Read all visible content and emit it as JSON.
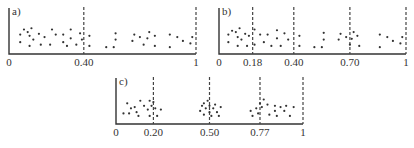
{
  "chart_data": [
    {
      "type": "scatter",
      "panel_label": "a)",
      "x_axis": {
        "min": 0,
        "max": 1,
        "tick_labels": [
          "0",
          "0.40",
          "1"
        ]
      },
      "dashed_lines": [
        0.4,
        1
      ],
      "layout": {
        "x0": 9,
        "x1": 196,
        "y_base": 54,
        "y_top": 8,
        "label_y": 66
      },
      "points": [
        [
          0.06,
          0.35
        ],
        [
          0.06,
          0.65
        ],
        [
          0.08,
          0.85
        ],
        [
          0.1,
          0.75
        ],
        [
          0.11,
          0.6
        ],
        [
          0.12,
          0.9
        ],
        [
          0.13,
          0.45
        ],
        [
          0.11,
          0.2
        ],
        [
          0.16,
          0.68
        ],
        [
          0.17,
          0.25
        ],
        [
          0.19,
          0.55
        ],
        [
          0.22,
          0.25
        ],
        [
          0.23,
          0.85
        ],
        [
          0.25,
          0.65
        ],
        [
          0.29,
          0.35
        ],
        [
          0.29,
          0.65
        ],
        [
          0.31,
          0.2
        ],
        [
          0.33,
          0.85
        ],
        [
          0.33,
          0.5
        ],
        [
          0.36,
          0.25
        ],
        [
          0.38,
          0.7
        ],
        [
          0.39,
          0.45
        ],
        [
          0.43,
          0.6
        ],
        [
          0.43,
          0.2
        ],
        [
          0.52,
          0.15
        ],
        [
          0.56,
          0.15
        ],
        [
          0.57,
          0.45
        ],
        [
          0.57,
          0.7
        ],
        [
          0.66,
          0.4
        ],
        [
          0.67,
          0.65
        ],
        [
          0.7,
          0.55
        ],
        [
          0.72,
          0.25
        ],
        [
          0.74,
          0.5
        ],
        [
          0.75,
          0.75
        ],
        [
          0.78,
          0.6
        ],
        [
          0.78,
          0.2
        ],
        [
          0.86,
          0.65
        ],
        [
          0.86,
          0.15
        ],
        [
          0.9,
          0.55
        ],
        [
          0.93,
          0.4
        ],
        [
          0.97,
          0.3
        ],
        [
          0.98,
          0.55
        ]
      ]
    },
    {
      "type": "scatter",
      "panel_label": "b)",
      "x_axis": {
        "min": 0,
        "max": 1,
        "tick_labels": [
          "0",
          "0.18",
          "0.40",
          "0.70",
          "1"
        ]
      },
      "dashed_lines": [
        0.18,
        0.4,
        0.7,
        1
      ],
      "layout": {
        "x0": 219,
        "x1": 406,
        "y_base": 54,
        "y_top": 8,
        "label_y": 66
      },
      "points": [
        [
          0.05,
          0.65
        ],
        [
          0.05,
          0.35
        ],
        [
          0.07,
          0.8
        ],
        [
          0.09,
          0.75
        ],
        [
          0.1,
          0.55
        ],
        [
          0.1,
          0.2
        ],
        [
          0.11,
          0.9
        ],
        [
          0.12,
          0.45
        ],
        [
          0.14,
          0.68
        ],
        [
          0.16,
          0.6
        ],
        [
          0.15,
          0.2
        ],
        [
          0.19,
          0.85
        ],
        [
          0.19,
          0.25
        ],
        [
          0.22,
          0.65
        ],
        [
          0.24,
          0.35
        ],
        [
          0.26,
          0.65
        ],
        [
          0.28,
          0.2
        ],
        [
          0.31,
          0.82
        ],
        [
          0.31,
          0.5
        ],
        [
          0.33,
          0.2
        ],
        [
          0.35,
          0.7
        ],
        [
          0.37,
          0.45
        ],
        [
          0.43,
          0.6
        ],
        [
          0.43,
          0.2
        ],
        [
          0.51,
          0.15
        ],
        [
          0.55,
          0.15
        ],
        [
          0.56,
          0.45
        ],
        [
          0.56,
          0.72
        ],
        [
          0.64,
          0.45
        ],
        [
          0.65,
          0.68
        ],
        [
          0.68,
          0.55
        ],
        [
          0.7,
          0.25
        ],
        [
          0.71,
          0.48
        ],
        [
          0.72,
          0.75
        ],
        [
          0.74,
          0.6
        ],
        [
          0.75,
          0.2
        ],
        [
          0.86,
          0.65
        ],
        [
          0.86,
          0.15
        ],
        [
          0.9,
          0.55
        ],
        [
          0.93,
          0.4
        ],
        [
          0.97,
          0.3
        ],
        [
          0.98,
          0.55
        ]
      ]
    },
    {
      "type": "scatter",
      "panel_label": "c)",
      "x_axis": {
        "min": 0,
        "max": 1,
        "tick_labels": [
          "0",
          "0.20",
          "0.50",
          "0.77",
          "1"
        ]
      },
      "dashed_lines": [
        0.2,
        0.5,
        0.77,
        1
      ],
      "layout": {
        "x0": 116,
        "x1": 303,
        "y_base": 124,
        "y_top": 78,
        "label_y": 136
      },
      "points": [
        [
          0.04,
          0.3
        ],
        [
          0.06,
          0.7
        ],
        [
          0.07,
          0.3
        ],
        [
          0.08,
          0.5
        ],
        [
          0.1,
          0.55
        ],
        [
          0.11,
          0.35
        ],
        [
          0.12,
          0.2
        ],
        [
          0.13,
          0.8
        ],
        [
          0.15,
          0.6
        ],
        [
          0.17,
          0.45
        ],
        [
          0.18,
          0.8
        ],
        [
          0.19,
          0.6
        ],
        [
          0.18,
          0.2
        ],
        [
          0.2,
          0.75
        ],
        [
          0.21,
          0.5
        ],
        [
          0.22,
          0.2
        ],
        [
          0.24,
          0.45
        ],
        [
          0.45,
          0.4
        ],
        [
          0.46,
          0.6
        ],
        [
          0.47,
          0.7
        ],
        [
          0.48,
          0.5
        ],
        [
          0.47,
          0.25
        ],
        [
          0.49,
          0.8
        ],
        [
          0.5,
          0.6
        ],
        [
          0.5,
          0.35
        ],
        [
          0.51,
          0.2
        ],
        [
          0.52,
          0.5
        ],
        [
          0.53,
          0.65
        ],
        [
          0.54,
          0.35
        ],
        [
          0.55,
          0.2
        ],
        [
          0.56,
          0.55
        ],
        [
          0.72,
          0.4
        ],
        [
          0.73,
          0.2
        ],
        [
          0.75,
          0.5
        ],
        [
          0.76,
          0.3
        ],
        [
          0.77,
          0.7
        ],
        [
          0.78,
          0.55
        ],
        [
          0.79,
          0.85
        ],
        [
          0.81,
          0.65
        ],
        [
          0.82,
          0.25
        ],
        [
          0.85,
          0.6
        ],
        [
          0.85,
          0.4
        ],
        [
          0.86,
          0.2
        ],
        [
          0.88,
          0.55
        ],
        [
          0.9,
          0.4
        ],
        [
          0.91,
          0.6
        ],
        [
          0.93,
          0.2
        ],
        [
          0.95,
          0.55
        ]
      ]
    }
  ]
}
